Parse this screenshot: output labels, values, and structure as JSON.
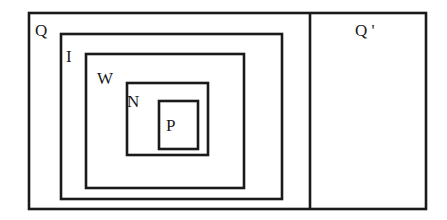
{
  "diagram": {
    "type": "nested-set-diagram",
    "universe_label": "Q",
    "complement_label": "Q '",
    "sets": [
      {
        "id": "Q",
        "label": "Q"
      },
      {
        "id": "I",
        "label": "I",
        "parent": "Q"
      },
      {
        "id": "W",
        "label": "W",
        "parent": "I"
      },
      {
        "id": "N",
        "label": "N",
        "parent": "W"
      },
      {
        "id": "P",
        "label": "P",
        "parent": "N"
      }
    ],
    "complement": {
      "id": "Q_prime",
      "label": "Q '"
    },
    "stroke_color": "#1a1a1a",
    "background_color": "#ffffff"
  }
}
